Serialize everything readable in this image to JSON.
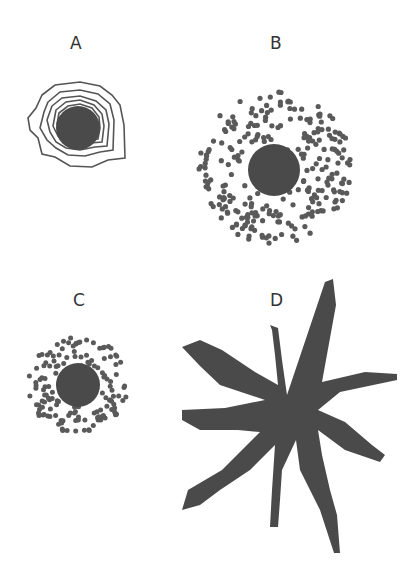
{
  "panels": [
    {
      "id": "A",
      "label": "A",
      "label_pos": [
        70,
        33
      ],
      "type": "nucleus-with-concentric-layers",
      "center": [
        78,
        128
      ],
      "core_radius": 22,
      "layers": 5
    },
    {
      "id": "B",
      "label": "B",
      "label_pos": [
        270,
        33
      ],
      "type": "nucleus-with-sparse-dispersed-dots",
      "center": [
        274,
        168
      ],
      "core_radius": 25,
      "scatter_radius": 78,
      "dot_count": 260
    },
    {
      "id": "C",
      "label": "C",
      "label_pos": [
        73,
        290
      ],
      "type": "nucleus-with-dense-close-dots",
      "center": [
        78,
        385
      ],
      "core_radius": 22,
      "scatter_radius": 50,
      "dot_count": 150
    },
    {
      "id": "D",
      "label": "D",
      "label_pos": [
        270,
        290
      ],
      "type": "star-shaped-dendritic-mass",
      "center": [
        290,
        412
      ],
      "arms": 9
    }
  ],
  "colors": {
    "fill": "#4a4a4a",
    "stroke": "#555555",
    "dot": "#5a5a5a",
    "text": "#333333"
  }
}
